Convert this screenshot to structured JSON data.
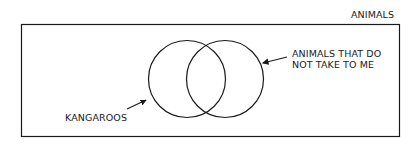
{
  "diagram": {
    "type": "venn",
    "universe_label": "ANIMALS",
    "sets": [
      {
        "label": "KANGAROOS"
      },
      {
        "label_line1": "ANIMALS THAT DO",
        "label_line2": "NOT TAKE TO ME"
      }
    ],
    "colors": {
      "stroke": "#1a1a1a",
      "background": "#ffffff"
    }
  }
}
